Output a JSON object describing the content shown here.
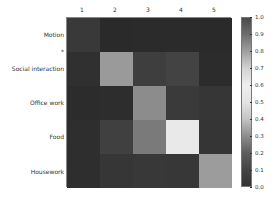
{
  "chart_data": {
    "type": "heatmap",
    "title": "",
    "xlabel": "",
    "ylabel": "",
    "x_tick_labels": [
      "1",
      "2",
      "3",
      "4",
      "5"
    ],
    "y_tick_labels": [
      "Motion",
      "*",
      "Social interaction",
      "Office work",
      "Food",
      "Housework"
    ],
    "rows": [
      "Motion",
      "Social interaction",
      "Office work",
      "Food",
      "Housework"
    ],
    "columns": [
      "1",
      "2",
      "3",
      "4",
      "5"
    ],
    "values": [
      [
        0.05,
        0.02,
        0.02,
        0.02,
        0.02
      ],
      [
        0.03,
        0.35,
        0.06,
        0.07,
        0.02
      ],
      [
        0.02,
        0.02,
        0.32,
        0.05,
        0.04
      ],
      [
        0.02,
        0.06,
        0.28,
        0.55,
        0.04
      ],
      [
        0.02,
        0.03,
        0.04,
        0.04,
        0.36
      ]
    ],
    "cell_colors": [
      [
        "#393939",
        "#2a2a2a",
        "#2b2b2b",
        "#2b2b2b",
        "#2a2a2a"
      ],
      [
        "#303030",
        "#9a9a9a",
        "#3e3e3e",
        "#434343",
        "#2c2c2c"
      ],
      [
        "#2c2c2c",
        "#2d2d2d",
        "#8c8c8c",
        "#3a3a3a",
        "#363636"
      ],
      [
        "#2e2e2e",
        "#404040",
        "#7a7a7a",
        "#e9e9e9",
        "#353535"
      ],
      [
        "#2e2e2e",
        "#363636",
        "#383838",
        "#373737",
        "#9c9c9c"
      ]
    ],
    "colorbar": {
      "range": [
        0.0,
        1.0
      ],
      "ticks": [
        "1.0",
        "0.9",
        "0.8",
        "0.7",
        "0.6",
        "0.5",
        "0.4",
        "0.3",
        "0.2",
        "0.1",
        "0.0"
      ],
      "colormap": "diverging grayscale (dark at 0.0 and 1.0, lightest near 0.6)"
    },
    "grid": false,
    "legend": "colorbar right"
  }
}
